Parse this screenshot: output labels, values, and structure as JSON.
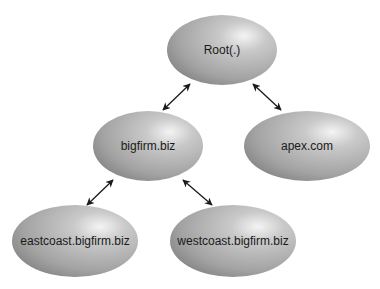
{
  "diagram": {
    "type": "tree",
    "nodes": [
      {
        "id": "root",
        "label": "Root(.)",
        "cx": 222,
        "cy": 50,
        "rx": 55,
        "ry": 35
      },
      {
        "id": "bigfirm",
        "label": "bigfirm.biz",
        "cx": 148,
        "cy": 146,
        "rx": 55,
        "ry": 35
      },
      {
        "id": "apex",
        "label": "apex.com",
        "cx": 307,
        "cy": 146,
        "rx": 63,
        "ry": 35
      },
      {
        "id": "eastcoast",
        "label": "eastcoast.bigfirm.biz",
        "cx": 75,
        "cy": 241,
        "rx": 63,
        "ry": 36
      },
      {
        "id": "westcoast",
        "label": "westcoast.bigfirm.biz",
        "cx": 233,
        "cy": 241,
        "rx": 63,
        "ry": 36
      }
    ],
    "edges": [
      {
        "from": "root",
        "to": "bigfirm",
        "bidirectional": true,
        "x1": 190,
        "y1": 84,
        "x2": 163,
        "y2": 110
      },
      {
        "from": "root",
        "to": "apex",
        "bidirectional": true,
        "x1": 253,
        "y1": 84,
        "x2": 281,
        "y2": 110
      },
      {
        "from": "bigfirm",
        "to": "eastcoast",
        "bidirectional": true,
        "x1": 113,
        "y1": 180,
        "x2": 87,
        "y2": 205
      },
      {
        "from": "bigfirm",
        "to": "westcoast",
        "bidirectional": true,
        "x1": 183,
        "y1": 180,
        "x2": 212,
        "y2": 205
      }
    ],
    "colors": {
      "node_light": "#f2f2f2",
      "node_mid": "#b5b5b5",
      "node_dark": "#7a7a7a",
      "arrow": "#1a1a1a",
      "text": "#1a1a1a"
    }
  }
}
